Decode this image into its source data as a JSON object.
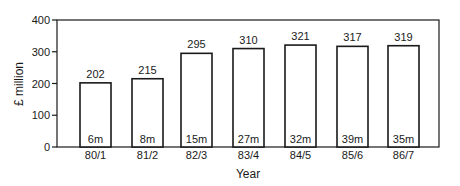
{
  "chart_data": {
    "type": "bar",
    "title": "",
    "xlabel": "Year",
    "ylabel": "£ million",
    "ylim": [
      0,
      400
    ],
    "yticks": [
      0,
      100,
      200,
      300,
      400
    ],
    "grid": false,
    "legend": null,
    "categories": [
      "80/1",
      "81/2",
      "82/3",
      "83/4",
      "84/5",
      "85/6",
      "86/7"
    ],
    "values": [
      202,
      215,
      295,
      310,
      321,
      317,
      319
    ],
    "value_labels": [
      "202",
      "215",
      "295",
      "310",
      "321",
      "317",
      "319"
    ],
    "inner_labels": [
      "6m",
      "8m",
      "15m",
      "27m",
      "32m",
      "39m",
      "35m"
    ],
    "bar_fill": "#ffffff",
    "bar_stroke": "#1a1a1a"
  }
}
